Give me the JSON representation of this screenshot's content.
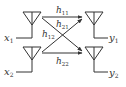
{
  "diagram": {
    "colors": {
      "stroke": "#333333",
      "background": "#ffffff"
    },
    "transmitters": [
      {
        "id": "tx1",
        "label": "x",
        "sub": "1"
      },
      {
        "id": "tx2",
        "label": "x",
        "sub": "2"
      }
    ],
    "receivers": [
      {
        "id": "rx1",
        "label": "y",
        "sub": "1"
      },
      {
        "id": "rx2",
        "label": "y",
        "sub": "2"
      }
    ],
    "channels": [
      {
        "id": "h11",
        "label": "h",
        "sub": "11",
        "from": "tx1",
        "to": "rx1"
      },
      {
        "id": "h21",
        "label": "h",
        "sub": "21",
        "from": "tx2",
        "to": "rx1"
      },
      {
        "id": "h12",
        "label": "h",
        "sub": "12",
        "from": "tx1",
        "to": "rx2"
      },
      {
        "id": "h22",
        "label": "h",
        "sub": "22",
        "from": "tx2",
        "to": "rx2"
      }
    ]
  }
}
